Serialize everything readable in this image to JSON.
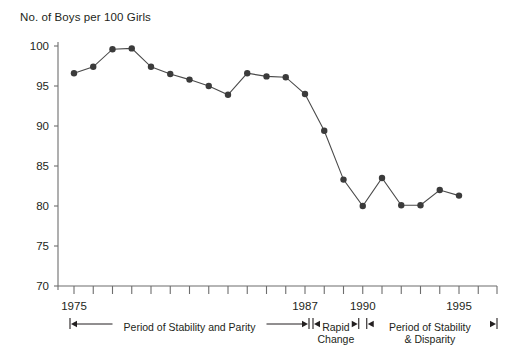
{
  "chart_data": {
    "type": "line",
    "title": "No. of Boys per 100 Girls",
    "xlabel": "",
    "ylabel": "",
    "ylim": [
      70,
      100
    ],
    "xlim": [
      1975,
      1996
    ],
    "grid": false,
    "legend": null,
    "ytick_labels": [
      "100",
      "95",
      "90",
      "85",
      "80",
      "75",
      "70"
    ],
    "ytick_values": [
      100,
      95,
      90,
      85,
      80,
      75,
      70
    ],
    "xtick_values": [
      1975,
      1976,
      1977,
      1978,
      1979,
      1980,
      1981,
      1982,
      1983,
      1984,
      1985,
      1986,
      1987,
      1988,
      1989,
      1990,
      1991,
      1992,
      1993,
      1994,
      1995,
      1996
    ],
    "xtick_labels_shown": [
      "1975",
      "1987",
      "1990",
      "1995"
    ],
    "x": [
      1975,
      1976,
      1977,
      1978,
      1979,
      1980,
      1981,
      1982,
      1983,
      1984,
      1985,
      1986,
      1987,
      1988,
      1989,
      1990,
      1991,
      1992,
      1993,
      1994,
      1995
    ],
    "values": [
      96.6,
      97.4,
      99.6,
      99.7,
      97.4,
      96.5,
      95.8,
      95.0,
      93.9,
      96.6,
      96.2,
      96.1,
      94.0,
      89.4,
      83.3,
      80.0,
      83.5,
      80.1,
      80.1,
      82.0,
      81.3
    ],
    "marker": "circle",
    "marker_color": "#3b3b3b",
    "line_color": "#4a4a4a",
    "annotations": [
      {
        "label": "Period of Stability and Parity",
        "start_year": 1975,
        "end_year": 1987
      },
      {
        "label": "Rapid\nChange",
        "line1": "Rapid",
        "line2": "Change",
        "start_year": 1987,
        "end_year": 1990
      },
      {
        "label": "Period of Stability\n& Disparity",
        "line1": "Period of Stability",
        "line2": "& Disparity",
        "start_year": 1990,
        "end_year": 1996
      }
    ]
  },
  "annotation_text": {
    "period1": "Period of Stability and Parity",
    "period2_line1": "Rapid",
    "period2_line2": "Change",
    "period3_line1": "Period of Stability",
    "period3_line2": "& Disparity"
  },
  "axis_labels": {
    "x1975": "1975",
    "x1987": "1987",
    "x1990": "1990",
    "x1995": "1995",
    "y100": "100",
    "y95": "95",
    "y90": "90",
    "y85": "85",
    "y80": "80",
    "y75": "75",
    "y70": "70"
  },
  "colors": {
    "ink": "#231f20",
    "axis": "#6d6d6d",
    "marker": "#3b3b3b",
    "line": "#4a4a4a",
    "background": "#ffffff"
  }
}
